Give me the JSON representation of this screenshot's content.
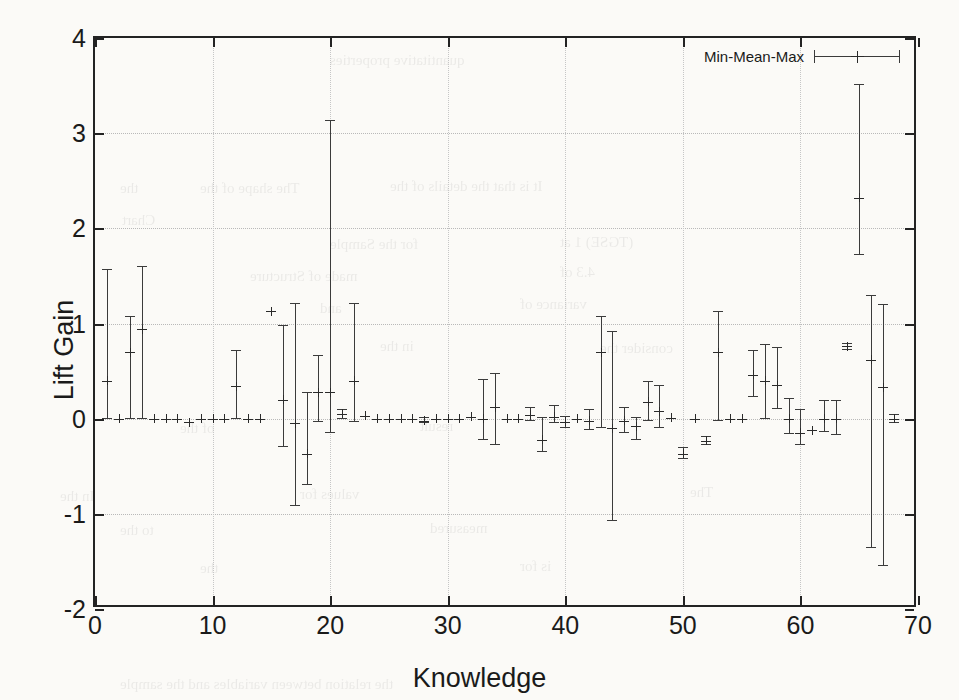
{
  "chart_data": {
    "type": "scatter",
    "title": "",
    "xlabel": "Knowledge",
    "ylabel": "Lift Gain",
    "xlim": [
      0,
      70
    ],
    "ylim": [
      -2,
      4
    ],
    "xticks": [
      0,
      10,
      20,
      30,
      40,
      50,
      60,
      70
    ],
    "yticks": [
      -2,
      -1,
      0,
      1,
      2,
      3,
      4
    ],
    "grid": true,
    "legend": {
      "position": "top-right",
      "entries": [
        "Min-Mean-Max"
      ]
    },
    "series": [
      {
        "name": "Min-Mean-Max",
        "marker": "errorbar-plus",
        "color": "#3b3b3b",
        "points": [
          {
            "x": 1,
            "mean": 0.4,
            "min": 0.0,
            "max": 1.57
          },
          {
            "x": 2,
            "mean": 0.0,
            "min": 0.0,
            "max": 0.0
          },
          {
            "x": 3,
            "mean": 0.7,
            "min": 0.0,
            "max": 1.08
          },
          {
            "x": 4,
            "mean": 0.94,
            "min": 0.0,
            "max": 1.6
          },
          {
            "x": 5,
            "mean": 0.0,
            "min": 0.0,
            "max": 0.0
          },
          {
            "x": 6,
            "mean": 0.0,
            "min": 0.0,
            "max": 0.0
          },
          {
            "x": 7,
            "mean": 0.0,
            "min": 0.0,
            "max": 0.0
          },
          {
            "x": 8,
            "mean": -0.04,
            "min": -0.04,
            "max": -0.04
          },
          {
            "x": 9,
            "mean": 0.0,
            "min": 0.0,
            "max": 0.0
          },
          {
            "x": 10,
            "mean": 0.0,
            "min": 0.0,
            "max": 0.0
          },
          {
            "x": 11,
            "mean": 0.0,
            "min": 0.0,
            "max": 0.0
          },
          {
            "x": 12,
            "mean": 0.34,
            "min": 0.0,
            "max": 0.72
          },
          {
            "x": 13,
            "mean": 0.0,
            "min": 0.0,
            "max": 0.0
          },
          {
            "x": 14,
            "mean": 0.0,
            "min": 0.0,
            "max": 0.0
          },
          {
            "x": 15,
            "mean": 1.13,
            "min": 1.13,
            "max": 1.13
          },
          {
            "x": 16,
            "mean": 0.2,
            "min": -0.3,
            "max": 0.98
          },
          {
            "x": 17,
            "mean": -0.05,
            "min": -0.92,
            "max": 1.22
          },
          {
            "x": 18,
            "mean": -0.37,
            "min": -0.7,
            "max": 0.28
          },
          {
            "x": 19,
            "mean": 0.28,
            "min": -0.04,
            "max": 0.67
          },
          {
            "x": 20,
            "mean": 0.28,
            "min": -0.15,
            "max": 3.14
          },
          {
            "x": 21,
            "mean": 0.05,
            "min": 0.0,
            "max": 0.1
          },
          {
            "x": 22,
            "mean": 0.4,
            "min": -0.03,
            "max": 1.22
          },
          {
            "x": 23,
            "mean": 0.03,
            "min": 0.03,
            "max": 0.03
          },
          {
            "x": 24,
            "mean": 0.0,
            "min": 0.0,
            "max": 0.0
          },
          {
            "x": 25,
            "mean": 0.0,
            "min": 0.0,
            "max": 0.0
          },
          {
            "x": 26,
            "mean": 0.0,
            "min": 0.0,
            "max": 0.0
          },
          {
            "x": 27,
            "mean": 0.0,
            "min": 0.0,
            "max": 0.0
          },
          {
            "x": 28,
            "mean": -0.02,
            "min": -0.05,
            "max": 0.02
          },
          {
            "x": 29,
            "mean": 0.0,
            "min": 0.0,
            "max": 0.0
          },
          {
            "x": 30,
            "mean": 0.0,
            "min": 0.0,
            "max": 0.0
          },
          {
            "x": 31,
            "mean": 0.0,
            "min": 0.0,
            "max": 0.0
          },
          {
            "x": 32,
            "mean": 0.02,
            "min": 0.02,
            "max": 0.02
          },
          {
            "x": 33,
            "mean": 0.0,
            "min": -0.22,
            "max": 0.42
          },
          {
            "x": 34,
            "mean": 0.12,
            "min": -0.28,
            "max": 0.48
          },
          {
            "x": 35,
            "mean": 0.0,
            "min": 0.0,
            "max": 0.0
          },
          {
            "x": 36,
            "mean": 0.0,
            "min": 0.0,
            "max": 0.0
          },
          {
            "x": 37,
            "mean": 0.04,
            "min": -0.02,
            "max": 0.12
          },
          {
            "x": 38,
            "mean": -0.22,
            "min": -0.35,
            "max": 0.02
          },
          {
            "x": 39,
            "mean": 0.02,
            "min": -0.05,
            "max": 0.14
          },
          {
            "x": 40,
            "mean": -0.03,
            "min": -0.1,
            "max": 0.03
          },
          {
            "x": 41,
            "mean": 0.0,
            "min": 0.0,
            "max": 0.0
          },
          {
            "x": 42,
            "mean": -0.02,
            "min": -0.12,
            "max": 0.1
          },
          {
            "x": 43,
            "mean": 0.7,
            "min": -0.1,
            "max": 1.08
          },
          {
            "x": 44,
            "mean": -0.1,
            "min": -1.08,
            "max": 0.92
          },
          {
            "x": 45,
            "mean": -0.02,
            "min": -0.15,
            "max": 0.12
          },
          {
            "x": 46,
            "mean": -0.08,
            "min": -0.22,
            "max": 0.02
          },
          {
            "x": 47,
            "mean": 0.18,
            "min": -0.02,
            "max": 0.4
          },
          {
            "x": 48,
            "mean": 0.08,
            "min": -0.1,
            "max": 0.35
          },
          {
            "x": 49,
            "mean": 0.01,
            "min": 0.01,
            "max": 0.01
          },
          {
            "x": 50,
            "mean": -0.37,
            "min": -0.42,
            "max": -0.3
          },
          {
            "x": 51,
            "mean": 0.0,
            "min": 0.0,
            "max": 0.0
          },
          {
            "x": 52,
            "mean": -0.23,
            "min": -0.28,
            "max": -0.18
          },
          {
            "x": 53,
            "mean": 0.7,
            "min": -0.02,
            "max": 1.13
          },
          {
            "x": 54,
            "mean": 0.0,
            "min": 0.0,
            "max": 0.0
          },
          {
            "x": 55,
            "mean": 0.0,
            "min": 0.0,
            "max": 0.0
          },
          {
            "x": 56,
            "mean": 0.46,
            "min": 0.23,
            "max": 0.72
          },
          {
            "x": 57,
            "mean": 0.4,
            "min": 0.0,
            "max": 0.78
          },
          {
            "x": 58,
            "mean": 0.35,
            "min": 0.1,
            "max": 0.75
          },
          {
            "x": 59,
            "mean": 0.0,
            "min": -0.16,
            "max": 0.22
          },
          {
            "x": 60,
            "mean": -0.15,
            "min": -0.28,
            "max": 0.1
          },
          {
            "x": 61,
            "mean": -0.12,
            "min": -0.12,
            "max": -0.12
          },
          {
            "x": 62,
            "mean": 0.0,
            "min": -0.14,
            "max": 0.2
          },
          {
            "x": 63,
            "mean": 0.0,
            "min": -0.17,
            "max": 0.2
          },
          {
            "x": 64,
            "mean": 0.76,
            "min": 0.72,
            "max": 0.8
          },
          {
            "x": 65,
            "mean": 2.32,
            "min": 1.72,
            "max": 3.52
          },
          {
            "x": 66,
            "mean": 0.62,
            "min": -1.36,
            "max": 1.3
          },
          {
            "x": 67,
            "mean": 0.33,
            "min": -1.55,
            "max": 1.2
          },
          {
            "x": 68,
            "mean": 0.0,
            "min": -0.05,
            "max": 0.05
          }
        ]
      }
    ]
  },
  "legend": {
    "label": "Min-Mean-Max"
  },
  "ghost_text": [
    {
      "t": "quantitative properties",
      "x": 330,
      "y": 52,
      "s": 15
    },
    {
      "t": "the",
      "x": 120,
      "y": 180,
      "s": 15
    },
    {
      "t": "The shape of the",
      "x": 200,
      "y": 180,
      "s": 15
    },
    {
      "t": "It is that the details of the",
      "x": 390,
      "y": 178,
      "s": 15
    },
    {
      "t": "Chart",
      "x": 122,
      "y": 212,
      "s": 15
    },
    {
      "t": "for the Sample",
      "x": 330,
      "y": 236,
      "s": 15
    },
    {
      "t": "(TGSE) 1 at",
      "x": 560,
      "y": 234,
      "s": 15
    },
    {
      "t": "made of Structure",
      "x": 250,
      "y": 268,
      "s": 15
    },
    {
      "t": "4.3 of",
      "x": 560,
      "y": 264,
      "s": 15
    },
    {
      "t": "and",
      "x": 320,
      "y": 300,
      "s": 15
    },
    {
      "t": "variance of",
      "x": 520,
      "y": 296,
      "s": 15
    },
    {
      "t": "in the",
      "x": 380,
      "y": 338,
      "s": 15
    },
    {
      "t": "consider the",
      "x": 600,
      "y": 340,
      "s": 15
    },
    {
      "t": "of the",
      "x": 180,
      "y": 420,
      "s": 15
    },
    {
      "t": "result",
      "x": 420,
      "y": 418,
      "s": 15
    },
    {
      "t": "In the",
      "x": 60,
      "y": 488,
      "s": 15
    },
    {
      "t": "values for",
      "x": 300,
      "y": 486,
      "s": 15
    },
    {
      "t": "The",
      "x": 690,
      "y": 484,
      "s": 15
    },
    {
      "t": "to the",
      "x": 120,
      "y": 522,
      "s": 15
    },
    {
      "t": "measured",
      "x": 430,
      "y": 520,
      "s": 15
    },
    {
      "t": "the",
      "x": 200,
      "y": 560,
      "s": 15
    },
    {
      "t": "is for",
      "x": 520,
      "y": 558,
      "s": 15
    },
    {
      "t": "the relation between variables and the sample",
      "x": 120,
      "y": 676,
      "s": 15
    }
  ]
}
